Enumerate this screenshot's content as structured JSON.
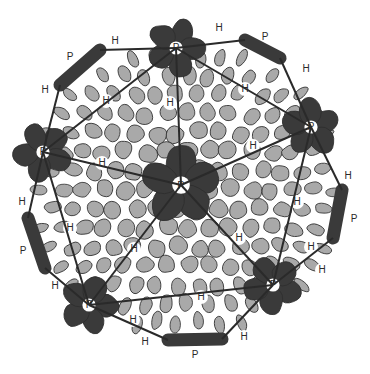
{
  "diagram": {
    "colors": {
      "background": "#ffffff",
      "hexon_fill": "#a9a9a9",
      "penton_fill": "#3a3a3a",
      "outline": "#2e2e2e",
      "edge_line": "#2a2a2a",
      "gap_fill": "#ffffff"
    },
    "legend_letters": {
      "penton": "P",
      "hexon": "H"
    },
    "pentons": [
      {
        "id": "center",
        "label": "P",
        "x": 181,
        "y": 185,
        "r": 40
      },
      {
        "id": "top",
        "label": "P",
        "x": 176,
        "y": 48,
        "r": 30
      },
      {
        "id": "upper-left",
        "label": "P",
        "x": 43,
        "y": 152,
        "r": 30
      },
      {
        "id": "upper-right",
        "label": "P",
        "x": 311,
        "y": 127,
        "r": 30
      },
      {
        "id": "lower-left",
        "label": "P",
        "x": 89,
        "y": 305,
        "r": 30
      },
      {
        "id": "lower-right",
        "label": "P",
        "x": 273,
        "y": 285,
        "r": 30
      }
    ],
    "rim_pentons": [
      {
        "id": "rim-top-left",
        "label": "P",
        "lx": 70,
        "ly": 57,
        "x1": 60,
        "y1": 85,
        "x2": 100,
        "y2": 50
      },
      {
        "id": "rim-top-right",
        "label": "P",
        "lx": 265,
        "ly": 37,
        "x1": 245,
        "y1": 40,
        "x2": 280,
        "y2": 58
      },
      {
        "id": "rim-left",
        "label": "P",
        "lx": 23,
        "ly": 251,
        "x1": 28,
        "y1": 218,
        "x2": 45,
        "y2": 268
      },
      {
        "id": "rim-right",
        "label": "P",
        "lx": 354,
        "ly": 219,
        "x1": 342,
        "y1": 190,
        "x2": 333,
        "y2": 238
      },
      {
        "id": "rim-bottom",
        "label": "P",
        "lx": 195,
        "ly": 355,
        "x1": 168,
        "y1": 340,
        "x2": 222,
        "y2": 339
      }
    ],
    "hexon_labels": [
      {
        "text": "H",
        "x": 115,
        "y": 41
      },
      {
        "text": "H",
        "x": 219,
        "y": 28
      },
      {
        "text": "H",
        "x": 45,
        "y": 90
      },
      {
        "text": "H",
        "x": 106,
        "y": 101
      },
      {
        "text": "H",
        "x": 170,
        "y": 103
      },
      {
        "text": "H",
        "x": 245,
        "y": 89
      },
      {
        "text": "H",
        "x": 306,
        "y": 69
      },
      {
        "text": "H",
        "x": 253,
        "y": 146
      },
      {
        "text": "H",
        "x": 102,
        "y": 163
      },
      {
        "text": "H",
        "x": 70,
        "y": 228
      },
      {
        "text": "H",
        "x": 22,
        "y": 202
      },
      {
        "text": "H",
        "x": 134,
        "y": 249
      },
      {
        "text": "H",
        "x": 133,
        "y": 320
      },
      {
        "text": "H",
        "x": 55,
        "y": 286
      },
      {
        "text": "H",
        "x": 239,
        "y": 238
      },
      {
        "text": "H",
        "x": 297,
        "y": 202
      },
      {
        "text": "H",
        "x": 348,
        "y": 176
      },
      {
        "text": "H",
        "x": 322,
        "y": 270
      },
      {
        "text": "H",
        "x": 201,
        "y": 297
      },
      {
        "text": "H",
        "x": 244,
        "y": 337
      },
      {
        "text": "H",
        "x": 145,
        "y": 342
      },
      {
        "text": "H",
        "x": 311,
        "y": 247
      }
    ],
    "edges": [
      [
        181,
        185,
        176,
        48
      ],
      [
        181,
        185,
        43,
        152
      ],
      [
        181,
        185,
        311,
        127
      ],
      [
        181,
        185,
        89,
        305
      ],
      [
        181,
        185,
        273,
        285
      ],
      [
        176,
        48,
        43,
        152
      ],
      [
        176,
        48,
        311,
        127
      ],
      [
        43,
        152,
        89,
        305
      ],
      [
        311,
        127,
        273,
        285
      ],
      [
        89,
        305,
        273,
        285
      ],
      [
        176,
        48,
        100,
        50
      ],
      [
        176,
        48,
        245,
        40
      ],
      [
        43,
        152,
        60,
        85
      ],
      [
        43,
        152,
        28,
        218
      ],
      [
        311,
        127,
        280,
        58
      ],
      [
        311,
        127,
        342,
        190
      ],
      [
        89,
        305,
        45,
        268
      ],
      [
        89,
        305,
        168,
        340
      ],
      [
        273,
        285,
        333,
        238
      ],
      [
        273,
        285,
        222,
        339
      ]
    ]
  }
}
